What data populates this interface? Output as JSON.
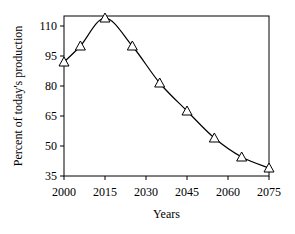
{
  "chart_data": {
    "type": "line",
    "title": "",
    "xlabel": "Years",
    "ylabel": "Percent of today's production",
    "xlim": [
      2000,
      2075
    ],
    "ylim": [
      35,
      115
    ],
    "xticks": [
      2000,
      2015,
      2030,
      2045,
      2060,
      2075
    ],
    "yticks": [
      35,
      50,
      65,
      80,
      95,
      110
    ],
    "grid": false,
    "legend": null,
    "series": [
      {
        "name": "production",
        "marker": "triangle-open",
        "x": [
          2000,
          2006,
          2015,
          2025,
          2035,
          2045,
          2055,
          2065,
          2075
        ],
        "values": [
          92,
          100,
          114,
          100,
          81.5,
          67.5,
          54,
          44.5,
          39
        ]
      }
    ]
  }
}
